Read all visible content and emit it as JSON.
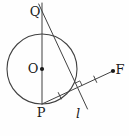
{
  "figure": {
    "type": "geometry-diagram",
    "width": 129,
    "height": 136,
    "background": "#fefefe",
    "stroke": "#414141",
    "text_color": "#1a1a1a",
    "circle": {
      "name": "circle-center-O",
      "cx": 42,
      "cy": 69,
      "r": 35
    },
    "lines": [
      {
        "name": "line-QP-through-center",
        "x1": 42,
        "y1": 3,
        "x2": 42,
        "y2": 104
      },
      {
        "name": "line-l-perpendicular-bisector",
        "x1": 38.7,
        "y1": 4,
        "x2": 87.5,
        "y2": 109
      },
      {
        "name": "segment-PF",
        "x1": 42,
        "y1": 104,
        "x2": 113,
        "y2": 71
      },
      {
        "name": "tick-mark-PM",
        "x1": 58.3,
        "y1": 92.6,
        "x2": 61.2,
        "y2": 98.9
      },
      {
        "name": "tick-mark-MF",
        "x1": 93.8,
        "y1": 76.1,
        "x2": 96.7,
        "y2": 82.4
      }
    ],
    "right_angle_mark": {
      "name": "right-angle-mark",
      "points": "75.4,83 79.9,80.9 82,85.4"
    },
    "dots": [
      {
        "name": "point-O-dot",
        "cx": 42,
        "cy": 69,
        "r": 2.1
      },
      {
        "name": "point-F-dot",
        "cx": 113,
        "cy": 71,
        "r": 2.1
      }
    ],
    "labels": [
      {
        "name": "label-Q",
        "text": "Q",
        "x": 35,
        "y": 16,
        "style": "normal"
      },
      {
        "name": "label-O",
        "text": "O",
        "x": 33,
        "y": 73,
        "style": "normal"
      },
      {
        "name": "label-P",
        "text": "P",
        "x": 41,
        "y": 117,
        "style": "normal"
      },
      {
        "name": "label-F",
        "text": "F",
        "x": 120,
        "y": 74,
        "style": "normal"
      },
      {
        "name": "label-l",
        "text": "l",
        "x": 78,
        "y": 118,
        "style": "italic"
      }
    ]
  }
}
